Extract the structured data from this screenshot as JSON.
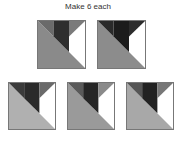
{
  "caption": "Make 6 each",
  "blocks": [
    {
      "id": "A",
      "x": 37,
      "y": 20,
      "size": 49,
      "colors": {
        "lower": "#8a8a8a",
        "left": "#6a6a6a",
        "center": "#2e2e2e",
        "right": "#7a7a7a",
        "white": "#ffffff"
      }
    },
    {
      "id": "B",
      "x": 97,
      "y": 20,
      "size": 49,
      "colors": {
        "lower": "#8c8c8c",
        "left": "#2a2a2a",
        "center": "#1c1c1c",
        "right": "#2c2c2c",
        "white": "#ffffff"
      }
    },
    {
      "id": "C",
      "x": 8,
      "y": 82,
      "size": 48,
      "colors": {
        "lower": "#b0b0b0",
        "left": "#3a3a3a",
        "center": "#2a2a2a",
        "right": "#6a6a6a",
        "white": "#ffffff"
      }
    },
    {
      "id": "D",
      "x": 67,
      "y": 82,
      "size": 48,
      "colors": {
        "lower": "#9a9a9a",
        "left": "#5a5a5a",
        "center": "#262626",
        "right": "#8a8a8a",
        "white": "#ffffff"
      }
    },
    {
      "id": "E",
      "x": 126,
      "y": 82,
      "size": 48,
      "colors": {
        "lower": "#a8a8a8",
        "left": "#555555",
        "center": "#222222",
        "right": "#777777",
        "white": "#ffffff"
      }
    }
  ]
}
